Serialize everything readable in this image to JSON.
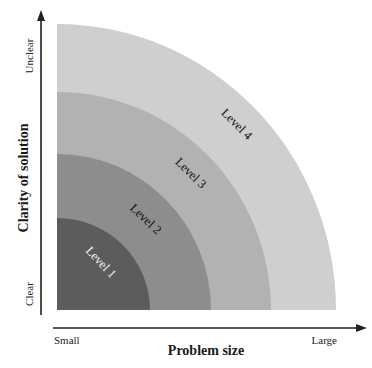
{
  "diagram": {
    "type": "nested-quarter-circles",
    "x_axis": {
      "label": "Problem size",
      "start_label": "Small",
      "end_label": "Large"
    },
    "y_axis": {
      "label": "Clarity of solution",
      "start_label": "Clear",
      "end_label": "Unclear"
    },
    "levels": [
      {
        "label": "Level 1",
        "color": "#5c5c5c",
        "text_color": "#f2f2f2"
      },
      {
        "label": "Level 2",
        "color": "#8d8d8d",
        "text_color": "#111111"
      },
      {
        "label": "Level 3",
        "color": "#b2b2b2",
        "text_color": "#111111"
      },
      {
        "label": "Level 4",
        "color": "#cfcfcf",
        "text_color": "#111111"
      }
    ],
    "axis_color": "#222222"
  }
}
